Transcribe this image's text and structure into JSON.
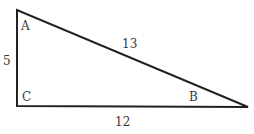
{
  "diagram": {
    "type": "right-triangle",
    "vertices": {
      "A": {
        "label": "A"
      },
      "B": {
        "label": "B"
      },
      "C": {
        "label": "C"
      }
    },
    "sides": {
      "AC": {
        "label": "5"
      },
      "AB": {
        "label": "13"
      },
      "CB": {
        "label": "12"
      }
    },
    "colors": {
      "stroke": "#222222",
      "text": "#3a3a3a"
    }
  }
}
